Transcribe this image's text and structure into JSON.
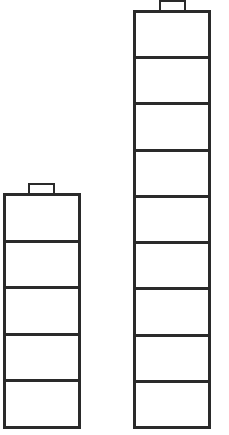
{
  "diagram": {
    "title": "",
    "stacks": [
      {
        "name": "short-stack",
        "cells": 5,
        "left": 3,
        "top": 193,
        "width": 78,
        "bottom": 429,
        "cap": {
          "left": 28,
          "top": 183,
          "width": 27,
          "height": 11
        }
      },
      {
        "name": "tall-stack",
        "cells": 9,
        "left": 133,
        "top": 10,
        "width": 78,
        "bottom": 429,
        "cap": {
          "left": 159,
          "top": 0,
          "width": 27,
          "height": 11
        }
      }
    ],
    "colors": {
      "stroke": "#2a2a2a",
      "fill": "#ffffff"
    }
  }
}
